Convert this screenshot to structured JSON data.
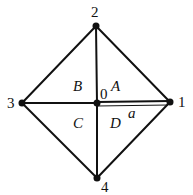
{
  "diagram": {
    "type": "graph",
    "nodes": [
      {
        "id": "0",
        "label": "0",
        "x": 97,
        "y": 103
      },
      {
        "id": "1",
        "label": "1",
        "x": 170,
        "y": 102
      },
      {
        "id": "2",
        "label": "2",
        "x": 96,
        "y": 26
      },
      {
        "id": "3",
        "label": "3",
        "x": 22,
        "y": 103
      },
      {
        "id": "4",
        "label": "4",
        "x": 97,
        "y": 178
      }
    ],
    "edges": [
      [
        "2",
        "1"
      ],
      [
        "2",
        "3"
      ],
      [
        "3",
        "4"
      ],
      [
        "4",
        "1"
      ],
      [
        "2",
        "0"
      ],
      [
        "0",
        "4"
      ],
      [
        "3",
        "0"
      ],
      [
        "0",
        "1"
      ],
      [
        "0",
        "1",
        "thin-a"
      ]
    ],
    "regions": {
      "A": "A",
      "B": "B",
      "C": "C",
      "D": "D"
    },
    "edge_label": "a",
    "colors": {
      "line": "#111111",
      "background": "#ffffff"
    }
  }
}
